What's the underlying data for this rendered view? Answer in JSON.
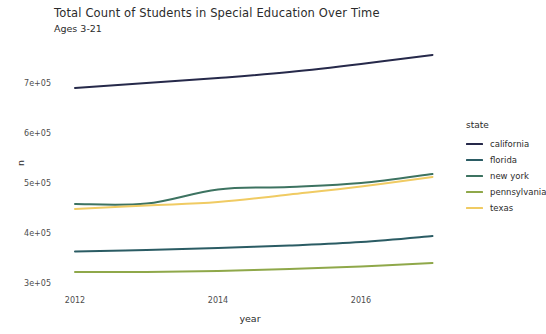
{
  "chart_data": {
    "type": "line",
    "title": "Total Count of Students in Special Education Over Time",
    "subtitle": "Ages 3-21",
    "xlabel": "year",
    "ylabel": "n",
    "x": [
      2012,
      2013,
      2014,
      2015,
      2016,
      2017
    ],
    "xticks": [
      "2012",
      "2014",
      "2016"
    ],
    "xtick_values": [
      2012,
      2014,
      2016
    ],
    "xlim": [
      2011.75,
      2017.25
    ],
    "yticks": [
      "3e+05",
      "4e+05",
      "5e+05",
      "6e+05",
      "7e+05"
    ],
    "ytick_values": [
      300000,
      400000,
      500000,
      600000,
      700000
    ],
    "ylim": [
      288000,
      760000
    ],
    "grid": false,
    "legend_position": "right",
    "legend_title": "state",
    "series": [
      {
        "name": "california",
        "color": "#26294a",
        "values": [
          690000,
          700000,
          710000,
          722000,
          738000,
          756000
        ]
      },
      {
        "name": "florida",
        "color": "#2b5c64",
        "values": [
          363000,
          366000,
          370000,
          375000,
          382000,
          394000
        ]
      },
      {
        "name": "new york",
        "color": "#3d7361",
        "values": [
          458000,
          459000,
          487000,
          492000,
          500000,
          518000
        ]
      },
      {
        "name": "pennsylvania",
        "color": "#8fa84a",
        "values": [
          322000,
          322000,
          324000,
          328000,
          333000,
          340000
        ]
      },
      {
        "name": "texas",
        "color": "#f0cb63",
        "values": [
          448000,
          455000,
          462000,
          477000,
          493000,
          512000
        ]
      }
    ]
  },
  "legend": {
    "title": "state",
    "items": [
      {
        "label": "california",
        "color": "#26294a"
      },
      {
        "label": "florida",
        "color": "#2b5c64"
      },
      {
        "label": "new york",
        "color": "#3d7361"
      },
      {
        "label": "pennsylvania",
        "color": "#8fa84a"
      },
      {
        "label": "texas",
        "color": "#f0cb63"
      }
    ]
  },
  "axes": {
    "x_title": "year",
    "y_title": "n",
    "x_tick_labels": [
      "2012",
      "2014",
      "2016"
    ],
    "y_tick_labels": [
      "3e+05",
      "4e+05",
      "5e+05",
      "6e+05",
      "7e+05"
    ]
  },
  "header": {
    "title": "Total Count of Students in Special Education Over Time",
    "subtitle": "Ages 3-21"
  }
}
